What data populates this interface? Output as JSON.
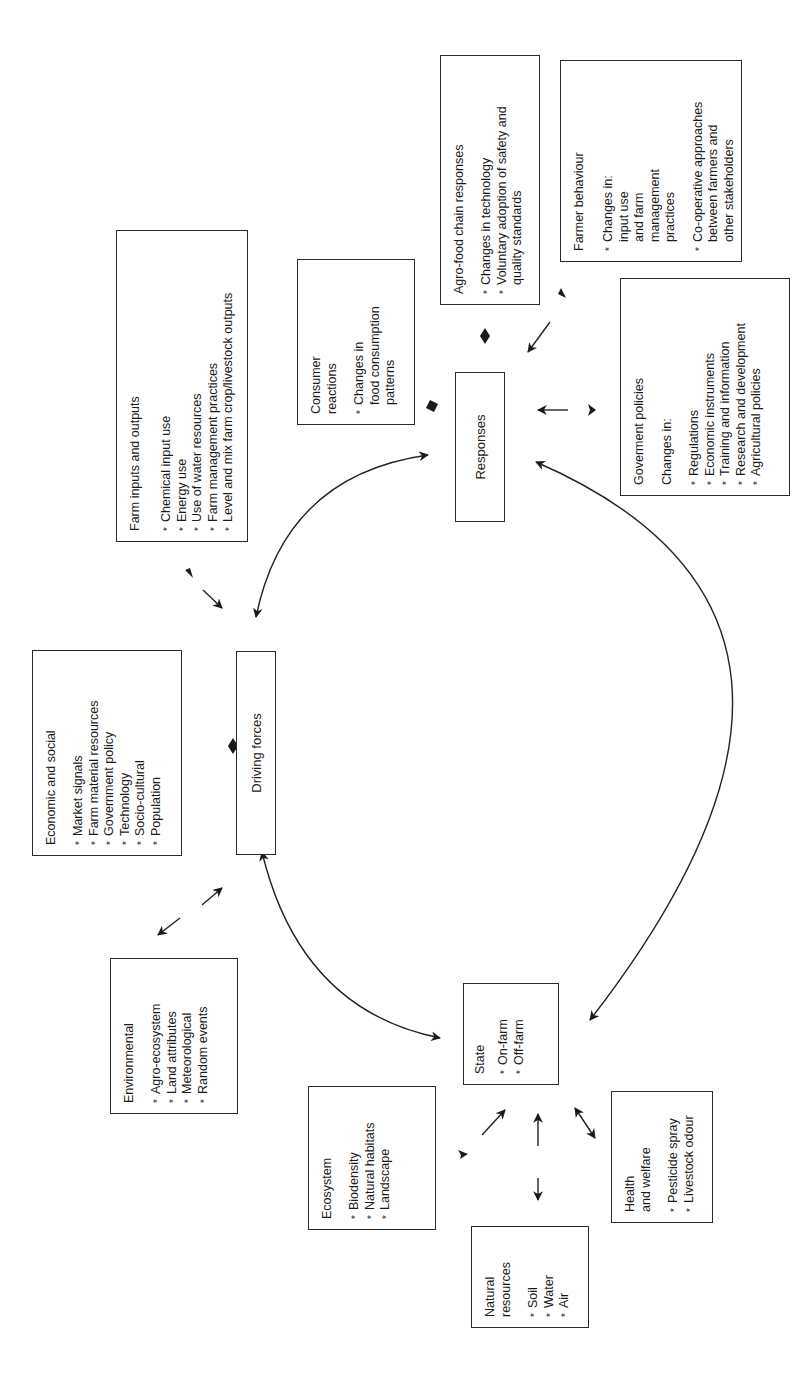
{
  "diagram": {
    "type": "driving-force-state-response framework",
    "orientation": "rotated 90 degrees counter-clockwise",
    "caption": "...sustainable agriculture (source: OECD",
    "central_nodes": {
      "driving_forces": "Driving forces",
      "state": {
        "title": "State",
        "items": [
          "On-farm",
          "Off-farm"
        ]
      },
      "responses": "Responses"
    },
    "driving_force_boxes": {
      "economic_social": {
        "title": "Economic and social",
        "items": [
          "Market signals",
          "Farm material resources",
          "Government policy",
          "Technology",
          "Socio-cultural",
          "Population"
        ]
      },
      "environmental": {
        "title": "Environmental",
        "items": [
          "Agro-ecosystem",
          "Land attributes",
          "Meteorological",
          "Random events"
        ]
      },
      "farm_inputs_outputs": {
        "title": "Farm inputs and outputs",
        "items": [
          "Chemical input use",
          "Energy use",
          "Use of water resources",
          "Farm management practices",
          "Level and mix farm crop/livestock outputs"
        ]
      }
    },
    "state_boxes": {
      "ecosystem": {
        "title": "Ecosystem",
        "items": [
          "Biodensity",
          "Natural habitats",
          "Landscape"
        ]
      },
      "natural_resources": {
        "title": "Natural\nresources",
        "items": [
          "Soil",
          "Water",
          "Air"
        ]
      },
      "health_welfare": {
        "title": "Health\nand welfare",
        "items": [
          "Pesticide spray",
          "Livestock odour"
        ]
      }
    },
    "response_boxes": {
      "consumer": {
        "title": "Consumer\nreactions",
        "items": [
          "Changes in\nfood consumption\npatterns"
        ]
      },
      "agro_food_chain": {
        "title": "Agro-food chain responses",
        "items": [
          "Changes in technology",
          "Voluntary adoption of safety and\nquality standards"
        ]
      },
      "farmer_behaviour": {
        "title": "Farmer behaviour",
        "items": [
          "Changes in:\ninput use\nand farm\nmanagement\npractices",
          "Co-operative approaches\nbetween farmers and\nother stakeholders"
        ]
      },
      "government_policies": {
        "title": "Goverment policies",
        "subtitle": "Changes in:",
        "items": [
          "Regulations",
          "Economic instruments",
          "Training and information",
          "Research and development",
          "Agricultural policies"
        ]
      }
    },
    "colors": {
      "line": "#2a2a2a",
      "background": "#ffffff",
      "text": "#1a1a1a"
    }
  }
}
